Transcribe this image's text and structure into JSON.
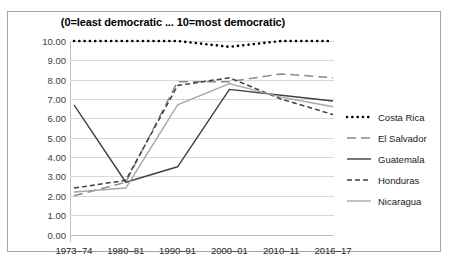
{
  "top_clipped_text": "",
  "chart": {
    "title": "(0=least democratic ... 10=most democratic)",
    "y_axis": {
      "labels": [
        "10.00",
        "9.00",
        "8.00",
        "7.00",
        "6.00",
        "5.00",
        "4.00",
        "3.00",
        "2.00",
        "1.00",
        "0.00"
      ],
      "min": 0,
      "max": 10,
      "step": 1
    },
    "x_axis": {
      "labels": [
        "1973–74",
        "1980–81",
        "1990–91",
        "2000–01",
        "2010–11",
        "2016–17"
      ]
    },
    "legend": [
      {
        "label": "Costa Rica",
        "style": "dotted",
        "color": "#000000"
      },
      {
        "label": "El Salvador",
        "style": "long-dash",
        "color": "#8c8c8c"
      },
      {
        "label": "Guatemala",
        "style": "solid",
        "color": "#404040"
      },
      {
        "label": "Honduras",
        "style": "short-dash",
        "color": "#404040"
      },
      {
        "label": "Nicaragua",
        "style": "solid-light",
        "color": "#a6a6a6"
      }
    ]
  },
  "chart_data": {
    "type": "line",
    "title": "(0=least democratic ... 10=most democratic)",
    "xlabel": "",
    "ylabel": "",
    "ylim": [
      0,
      10
    ],
    "grid": true,
    "legend_position": "right",
    "categories": [
      "1973–74",
      "1980–81",
      "1990–91",
      "2000–01",
      "2010–11",
      "2016–17"
    ],
    "series": [
      {
        "name": "Costa Rica",
        "style": "dotted",
        "color": "#000000",
        "values": [
          10.0,
          10.0,
          10.0,
          9.7,
          10.0,
          10.0
        ]
      },
      {
        "name": "El Salvador",
        "style": "long-dash",
        "color": "#8c8c8c",
        "values": [
          2.0,
          2.7,
          7.9,
          7.9,
          8.3,
          8.1
        ]
      },
      {
        "name": "Guatemala",
        "style": "solid",
        "color": "#404040",
        "values": [
          6.7,
          2.7,
          3.5,
          7.5,
          7.2,
          6.9
        ]
      },
      {
        "name": "Honduras",
        "style": "short-dash",
        "color": "#404040",
        "values": [
          2.4,
          2.8,
          7.7,
          8.1,
          7.0,
          6.2
        ]
      },
      {
        "name": "Nicaragua",
        "style": "solid-light",
        "color": "#a6a6a6",
        "values": [
          2.2,
          2.4,
          6.7,
          7.8,
          7.1,
          6.6
        ]
      }
    ]
  }
}
